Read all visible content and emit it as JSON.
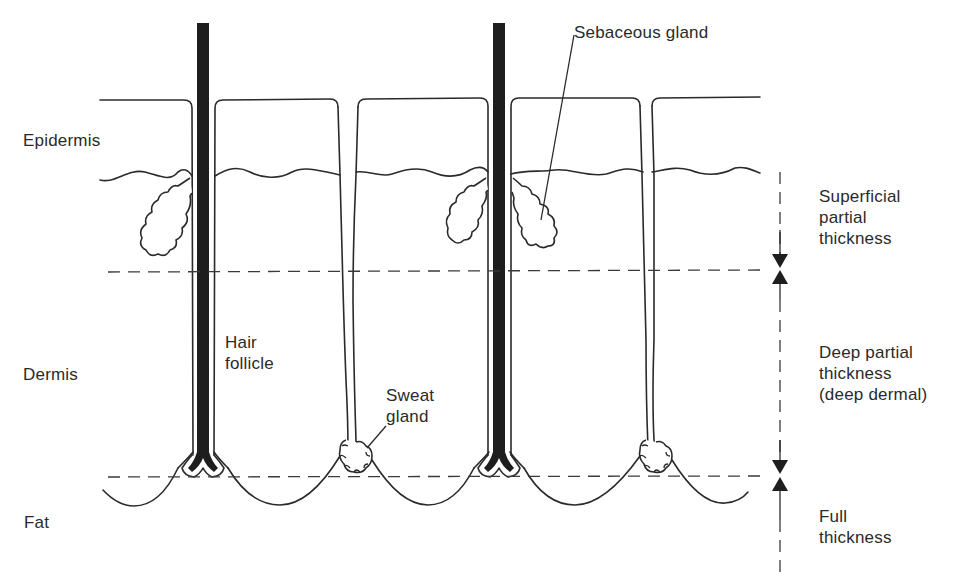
{
  "diagram": {
    "layers": [
      {
        "id": "epidermis",
        "label": "Epidermis"
      },
      {
        "id": "dermis",
        "label": "Dermis"
      },
      {
        "id": "fat",
        "label": "Fat"
      }
    ],
    "structures": [
      {
        "id": "hair-follicle",
        "label": "Hair\nfollicle"
      },
      {
        "id": "sweat-gland",
        "label": "Sweat\ngland"
      },
      {
        "id": "sebaceous-gland",
        "label": "Sebaceous gland"
      }
    ],
    "burn_depths": [
      {
        "id": "superficial-partial",
        "label": "Superficial\npartial\nthickness"
      },
      {
        "id": "deep-partial",
        "label": "Deep partial\nthickness\n(deep dermal)"
      },
      {
        "id": "full",
        "label": "Full\nthickness"
      }
    ],
    "colors": {
      "line": "#2a2a2a",
      "hair": "#1e1e1e",
      "background": "#ffffff"
    }
  }
}
